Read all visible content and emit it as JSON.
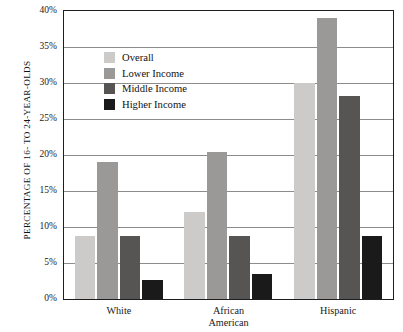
{
  "chart_data": {
    "type": "bar",
    "title": "",
    "xlabel": "",
    "ylabel": "PERCENTAGE OF 16- TO 24-YEAR-OLDS",
    "ylim": [
      0,
      40
    ],
    "ytick_labels": [
      "0%",
      "5%",
      "10%",
      "15%",
      "20%",
      "25%",
      "30%",
      "35%",
      "40%"
    ],
    "ytick_values": [
      0,
      5,
      10,
      15,
      20,
      25,
      30,
      35,
      40
    ],
    "grid": true,
    "legend_position": "upper-left-inside",
    "categories": [
      "White",
      "African American",
      "Hispanic"
    ],
    "category_lines": [
      [
        "White"
      ],
      [
        "African",
        "American"
      ],
      [
        "Hispanic"
      ]
    ],
    "series": [
      {
        "name": "Overall",
        "color": "#cccbc9",
        "values": [
          8.8,
          12.1,
          30.0
        ]
      },
      {
        "name": "Lower Income",
        "color": "#9a9997",
        "values": [
          19.0,
          20.4,
          39.1
        ]
      },
      {
        "name": "Middle Income",
        "color": "#565554",
        "values": [
          8.8,
          8.7,
          28.2
        ]
      },
      {
        "name": "Higher Income",
        "color": "#1a1a1a",
        "values": [
          2.7,
          3.5,
          8.8
        ]
      }
    ]
  }
}
